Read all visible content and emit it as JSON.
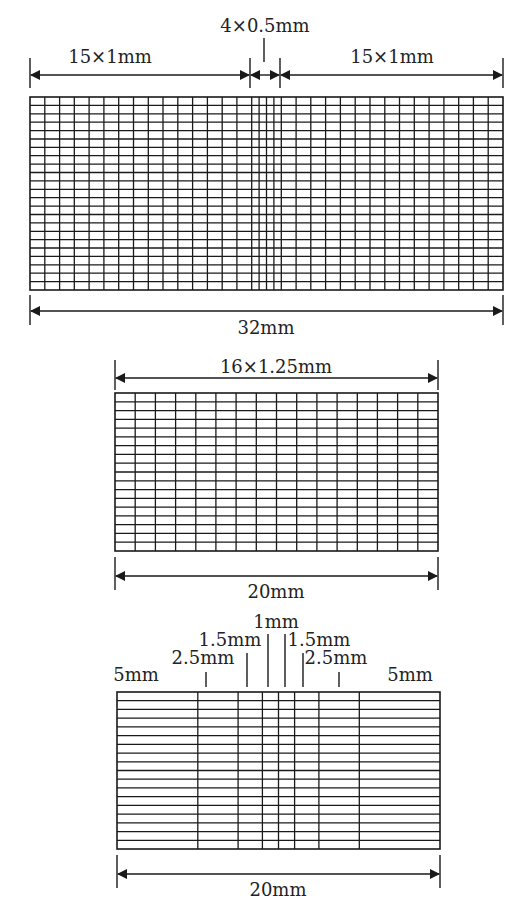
{
  "diagrams": [
    {
      "id": "mesh-refined-center",
      "top_labels": [
        "15×1mm",
        "4×0.5mm",
        "15×1mm"
      ],
      "bottom_label": "32mm",
      "columns_mm": [
        1,
        1,
        1,
        1,
        1,
        1,
        1,
        1,
        1,
        1,
        1,
        1,
        1,
        1,
        1,
        0.5,
        0.5,
        0.5,
        0.5,
        1,
        1,
        1,
        1,
        1,
        1,
        1,
        1,
        1,
        1,
        1,
        1,
        1,
        1,
        1
      ],
      "rows": 23
    },
    {
      "id": "mesh-uniform",
      "top_label": "16×1.25mm",
      "bottom_label": "20mm",
      "columns": 16,
      "rows": 18
    },
    {
      "id": "mesh-graded",
      "segment_labels": [
        "5mm",
        "2.5mm",
        "1.5mm",
        "1mm",
        "1.5mm",
        "2.5mm",
        "5mm"
      ],
      "columns_mm": [
        5,
        2.5,
        1.5,
        1,
        1,
        1.5,
        2.5,
        5
      ],
      "bottom_label": "20mm",
      "rows": 18
    }
  ],
  "colors": {
    "line": "#1a1a1a",
    "background": "#ffffff",
    "text": "#222222"
  }
}
